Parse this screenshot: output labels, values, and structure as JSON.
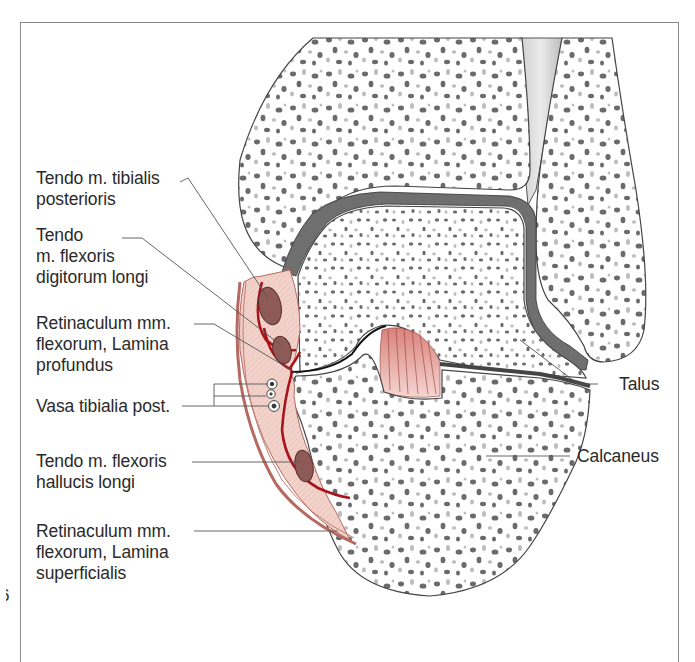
{
  "figure": {
    "page_number_fragment": "6",
    "labels": {
      "tibialis_posterior": {
        "line1": "Tendo m. tibialis",
        "line2": "posterioris"
      },
      "flexor_digitorum": {
        "line1": "Tendo",
        "line2": "m. flexoris",
        "line3": "digitorum longi"
      },
      "retinaculum_profundus": {
        "line1": "Retinaculum mm.",
        "line2": "flexorum, Lamina",
        "line3": "profundus"
      },
      "vasa": {
        "line1": "Vasa tibialia post."
      },
      "flexor_hallucis": {
        "line1": "Tendo m. flexoris",
        "line2": "hallucis longi"
      },
      "retinaculum_superficialis": {
        "line1": "Retinaculum mm.",
        "line2": "flexorum, Lamina",
        "line3": "superficialis"
      },
      "talus": {
        "line1": "Talus"
      },
      "calcaneus": {
        "line1": "Calcaneus"
      }
    },
    "colors": {
      "bone_fill": "#ffffff",
      "trabecula": "#6a6a6a",
      "trabecula_light": "#bdbdbd",
      "cartilage": "#6f6f6f",
      "soft_tissue": "#f2d3cc",
      "retinaculum": "#a8141c",
      "tendon": "#8e5a58",
      "ligament": "#e5a29c",
      "leader_line": "#555555",
      "frame": "#8a8a8a"
    }
  }
}
